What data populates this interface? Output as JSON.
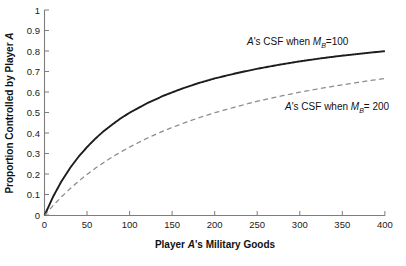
{
  "chart_data": {
    "type": "line",
    "title": "",
    "xlabel": "Player A's Military Goods",
    "ylabel": "Proportion Controlled by Player A",
    "xlim": [
      0,
      400
    ],
    "ylim": [
      0,
      1
    ],
    "grid": false,
    "legend_position": "inline-annotations",
    "xticks": [
      "0",
      "50",
      "100",
      "150",
      "200",
      "250",
      "300",
      "350",
      "400"
    ],
    "xtick_values": [
      0,
      50,
      100,
      150,
      200,
      250,
      300,
      350,
      400
    ],
    "yticks": [
      "0",
      "0.1",
      "0.2",
      "0.3",
      "0.4",
      "0.5",
      "0.6",
      "0.7",
      "0.8",
      "0.9",
      "1"
    ],
    "ytick_values": [
      0,
      0.1,
      0.2,
      0.3,
      0.4,
      0.5,
      0.6,
      0.7,
      0.8,
      0.9,
      1
    ],
    "x": [
      0,
      10,
      20,
      30,
      40,
      50,
      60,
      70,
      80,
      90,
      100,
      120,
      140,
      160,
      180,
      200,
      225,
      250,
      275,
      300,
      325,
      350,
      375,
      400
    ],
    "series": [
      {
        "name": "A's CSF when M_B = 100",
        "style": "solid",
        "color": "#1c1c1c",
        "formula": "M / (M + 100)",
        "values": [
          0,
          0.091,
          0.167,
          0.231,
          0.286,
          0.333,
          0.375,
          0.412,
          0.444,
          0.474,
          0.5,
          0.545,
          0.583,
          0.615,
          0.643,
          0.667,
          0.692,
          0.714,
          0.733,
          0.75,
          0.765,
          0.778,
          0.789,
          0.8
        ]
      },
      {
        "name": "A's CSF when M_B = 200",
        "style": "dashed",
        "color": "#8b8b8b",
        "formula": "M / (M + 200)",
        "values": [
          0,
          0.048,
          0.091,
          0.13,
          0.167,
          0.2,
          0.231,
          0.259,
          0.286,
          0.31,
          0.333,
          0.375,
          0.412,
          0.444,
          0.474,
          0.5,
          0.529,
          0.556,
          0.579,
          0.6,
          0.619,
          0.636,
          0.652,
          0.667
        ]
      }
    ],
    "annotations": [
      {
        "id": "annotation-csf-100",
        "prefix": "A",
        "mid": "'s CSF when ",
        "var": "M",
        "subscript": "B",
        "suffix": "=100"
      },
      {
        "id": "annotation-csf-200",
        "prefix": "A",
        "mid": "'s CSF when ",
        "var": "M",
        "subscript": "B",
        "suffix": "= 200"
      }
    ]
  },
  "axis": {
    "x_title_prefix": "Player ",
    "x_title_italic": "A",
    "x_title_suffix": "'s Military Goods",
    "y_title_prefix": "Proportion Controlled by Player ",
    "y_title_italic": "A"
  }
}
